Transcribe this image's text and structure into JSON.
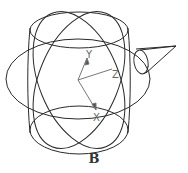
{
  "figure": {
    "caption": "B",
    "axes": {
      "x_label": "X",
      "y_label": "Y",
      "z_label": "Z"
    },
    "colors": {
      "stroke": "#2a2a2a",
      "axis": "#777777",
      "background": "#ffffff"
    }
  }
}
